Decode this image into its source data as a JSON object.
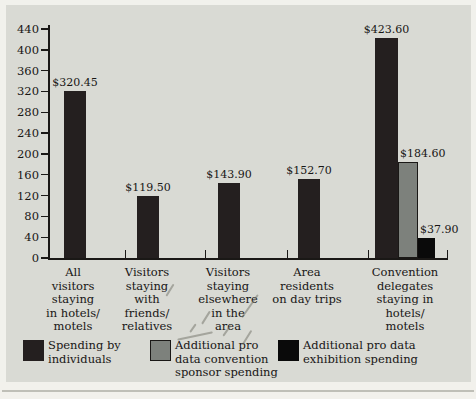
{
  "figure": {
    "panel_background": "#d9dad4",
    "page_background": "#f1f1ec"
  },
  "chart_data": {
    "type": "bar",
    "title": "",
    "xlabel": "",
    "ylabel": "",
    "ylim": [
      0,
      440
    ],
    "yticks": [
      440,
      400,
      360,
      320,
      280,
      240,
      200,
      160,
      120,
      80,
      40,
      0
    ],
    "grid": false,
    "legend_position": "bottom",
    "series": [
      {
        "key": "individuals",
        "name": "Spending by individuals",
        "color": "#241f1f"
      },
      {
        "key": "sponsor",
        "name": "Additional pro data convention sponsor spending",
        "color": "#7d817c"
      },
      {
        "key": "exhibition",
        "name": "Additional pro data exhibition spending",
        "color": "#0a0a0a"
      }
    ],
    "categories": [
      {
        "label": "All\nvisitors\nstaying\nin hotels/\nmotels",
        "bars": [
          {
            "series": "individuals",
            "value": 320.45,
            "label": "$320.45"
          }
        ]
      },
      {
        "label": "Visitors\nstaying\nwith\nfriends/\nrelatives",
        "bars": [
          {
            "series": "individuals",
            "value": 119.5,
            "label": "$119.50"
          }
        ]
      },
      {
        "label": "Visitors\nstaying\nelsewhere\nin the\narea",
        "bars": [
          {
            "series": "individuals",
            "value": 143.9,
            "label": "$143.90"
          }
        ]
      },
      {
        "label": "Area\nresidents\non day trips",
        "bars": [
          {
            "series": "individuals",
            "value": 152.7,
            "label": "$152.70"
          }
        ]
      },
      {
        "label": "Convention\ndelegates\nstaying in\nhotels/\nmotels",
        "bars": [
          {
            "series": "individuals",
            "value": 423.6,
            "label": "$423.60"
          },
          {
            "series": "sponsor",
            "value": 184.6,
            "label": "$184.60"
          },
          {
            "series": "exhibition",
            "value": 37.9,
            "label": "$37.90"
          }
        ]
      }
    ],
    "legend": [
      {
        "series": "individuals",
        "label": "Spending by\nindividuals"
      },
      {
        "series": "sponsor",
        "label": "Additional pro\ndata convention\nsponsor spending"
      },
      {
        "series": "exhibition",
        "label": "Additional pro data\nexhibition spending"
      }
    ]
  }
}
